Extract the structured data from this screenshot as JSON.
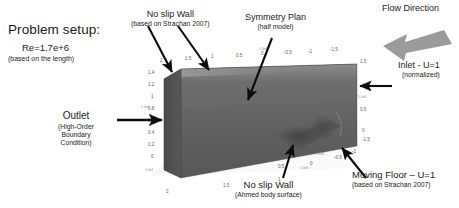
{
  "figure": {
    "background_color": "#ffffff",
    "body_colors": {
      "top_face": "#6f6f6f",
      "front_face": "#636363",
      "end_face": "#4e4e4e",
      "edge_highlight": "#8f8f8f"
    },
    "arrow_color": "#111111",
    "flow_arrow_color": "#9a9a9a"
  },
  "problem_setup": {
    "title": "Problem setup:",
    "reynolds": "Re=1.7e+6",
    "reynolds_note": "(based on the length)"
  },
  "annotations": {
    "no_slip_wall_top": {
      "label": "No slip Wall",
      "note": "(based on Strachan 2007)"
    },
    "symmetry_plan": {
      "label": "Symmetry Plan",
      "note": "(half model)"
    },
    "flow_direction": {
      "label": "Flow Direction"
    },
    "inlet": {
      "label": "Inlet - U=1",
      "note": "(normalized)"
    },
    "outlet": {
      "label": "Outlet",
      "note_line1": "(High-Order",
      "note_line2": "Boundary",
      "note_line3": "Condition)"
    },
    "no_slip_wall_bottom": {
      "label": "No slip Wall",
      "note": "(Ahmed body surface)"
    },
    "moving_floor": {
      "label": "Moving Floor – U=1",
      "note": "(based on Strachan 2007)"
    }
  },
  "axes": {
    "top_edge_ticks": [
      "2",
      "1.5",
      "1",
      "0.5",
      "0",
      "-0.5",
      "-1",
      "-1.5"
    ],
    "left_vertical_ticks": [
      "1.4",
      "1.2",
      "1",
      "0.8",
      "0.6",
      "0.4",
      "0.2",
      "0"
    ],
    "right_vertical_ticks": [
      "1.5",
      "1",
      "0.5",
      "0"
    ],
    "bottom_left_ticks": [
      "2",
      "1.5",
      "1"
    ],
    "bottom_right_ticks": [
      "0.5",
      "0",
      "-0.5",
      "-1",
      "-1.5"
    ],
    "corner_tick_left": "2",
    "corner_tick_right": "2",
    "minor_marks": [
      "1.4e4",
      "1.4e4",
      "1.4e4",
      "1.4e4",
      "1.4e4",
      "1.4e4"
    ]
  }
}
